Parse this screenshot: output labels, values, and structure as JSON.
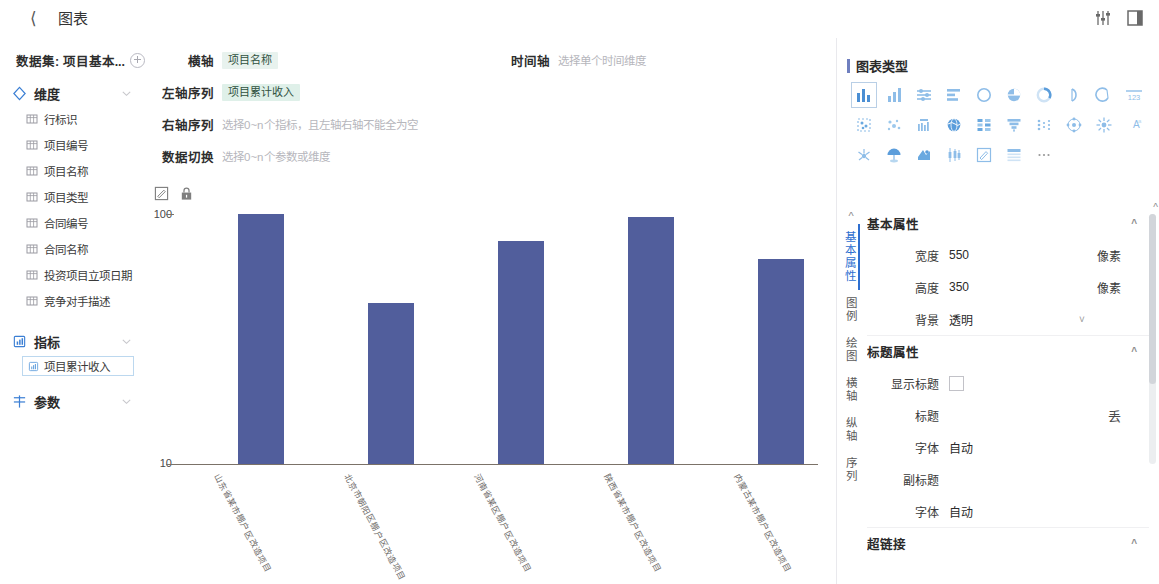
{
  "header": {
    "back_icon": "chevron-left-icon",
    "title": "图表",
    "icon_sliders": "sliders-icon",
    "icon_panel": "layout-panel-icon"
  },
  "sidebar": {
    "dataset_label": "数据集: 项目基本...",
    "add_icon": "add-circle-icon",
    "dimension_group": {
      "label": "维度",
      "icon": "diamond-icon"
    },
    "dimensions": [
      {
        "label": "行标识",
        "icon": "table-field-icon"
      },
      {
        "label": "项目编号",
        "icon": "table-field-icon"
      },
      {
        "label": "项目名称",
        "icon": "table-field-icon"
      },
      {
        "label": "项目类型",
        "icon": "table-field-icon"
      },
      {
        "label": "合同编号",
        "icon": "table-field-icon"
      },
      {
        "label": "合同名称",
        "icon": "table-field-icon"
      },
      {
        "label": "投资项目立项日期",
        "icon": "table-field-icon"
      },
      {
        "label": "竞争对手描述",
        "icon": "table-field-icon"
      }
    ],
    "metric_group": {
      "label": "指标",
      "icon": "metric-icon"
    },
    "metrics": [
      {
        "label": "项目累计收入",
        "icon": "metric-icon"
      }
    ],
    "param_group": {
      "label": "参数",
      "icon": "param-icon"
    }
  },
  "config": {
    "x_axis": {
      "label": "横轴",
      "value": "项目名称"
    },
    "left_series": {
      "label": "左轴序列",
      "value": "项目累计收入"
    },
    "right_series": {
      "label": "右轴序列",
      "placeholder": "选择0~n个指标，且左轴右轴不能全为空"
    },
    "data_switch": {
      "label": "数据切换",
      "placeholder": "选择0~n个参数或维度"
    },
    "time_axis": {
      "label": "时间轴",
      "placeholder": "选择单个时间维度"
    },
    "tool_edit_icon": "edit-box-icon",
    "tool_lock_icon": "lock-icon"
  },
  "chart_data": {
    "type": "bar",
    "title": "",
    "xlabel": "项目名称",
    "ylabel": "项目累计收入",
    "yscale": "log",
    "ylim": [
      10,
      100
    ],
    "ytick_labels": [
      "100",
      "10"
    ],
    "grid": false,
    "legend": "none",
    "bar_color": "#515e9c",
    "axis_color": "#7b7268",
    "categories": [
      "山东省某市棚户区改造项目",
      "北京市朝阳区棚户区改造项目",
      "河南省某区棚户区改造项目",
      "陕西省某市棚户区改造项目",
      "内蒙古某市棚户区改造项目"
    ],
    "values": [
      100,
      44,
      78,
      97,
      66
    ]
  },
  "right_panel": {
    "chart_type_title": "图表类型",
    "chart_type_icons": [
      "column-chart-icon",
      "bar-group-icon",
      "range-bar-icon",
      "horizontal-bar-icon",
      "ring-icon",
      "pie-chart-icon",
      "donut-progress-icon",
      "gauge-half-icon",
      "gauge-arc-icon",
      "number-123-icon",
      "scatter-box-icon",
      "bubble-scatter-icon",
      "box-plot-icon",
      "globe-map-icon",
      "stacked-grid-icon",
      "funnel-icon",
      "dot-matrix-icon",
      "network-graph-icon",
      "radial-burst-icon",
      "word-cloud-icon",
      "sunburst-icon",
      "umbrella-tree-icon",
      "map-pin-icon",
      "candlestick-icon",
      "text-edit-icon",
      "table-icon",
      "more-dots-icon"
    ],
    "selected_chart_type_index": 0,
    "vertical_tabs": [
      "基本属性",
      "图例",
      "绘图",
      "横轴",
      "纵轴",
      "序列"
    ],
    "active_vertical_tab": "基本属性",
    "sections": [
      {
        "title": "基本属性",
        "rows": [
          {
            "label": "宽度",
            "value": "550",
            "unit": "像素",
            "kind": "text"
          },
          {
            "label": "高度",
            "value": "350",
            "unit": "像素",
            "kind": "text"
          },
          {
            "label": "背景",
            "value": "透明",
            "unit": "",
            "kind": "select"
          }
        ]
      },
      {
        "title": "标题属性",
        "rows": [
          {
            "label": "显示标题",
            "value": "",
            "unit": "",
            "kind": "checkbox"
          },
          {
            "label": "标题",
            "value": "",
            "unit": "",
            "kind": "text-fx",
            "fx": "丢"
          },
          {
            "label": "字体",
            "value": "自动",
            "unit": "",
            "kind": "text"
          },
          {
            "label": "副标题",
            "value": "",
            "unit": "",
            "kind": "text"
          },
          {
            "label": "字体",
            "value": "自动",
            "unit": "",
            "kind": "text"
          }
        ]
      },
      {
        "title": "超链接",
        "rows": []
      }
    ]
  }
}
